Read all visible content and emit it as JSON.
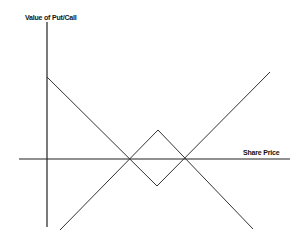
{
  "diagram": {
    "type": "option payoff diagram",
    "y_axis_label": "Value of Put/Call",
    "x_axis_label": "Share Price",
    "line_color": "#333333",
    "axis_color": "#222222",
    "axes": {
      "vertical": {
        "x": 47,
        "y1": 22,
        "y2": 227
      },
      "horizontal": {
        "y": 159,
        "x1": 19,
        "x2": 290
      }
    },
    "lines": [
      {
        "name": "put-payoff-line",
        "points": "47,77 157,186 270,72"
      },
      {
        "name": "call-payoff-line",
        "points": "60,230 158,130 253,229"
      }
    ],
    "intersections": [
      {
        "x": 130,
        "y": 159
      },
      {
        "x": 185,
        "y": 159
      }
    ]
  }
}
